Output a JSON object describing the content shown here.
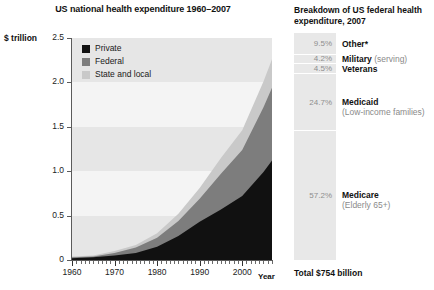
{
  "chart_data": [
    {
      "type": "area",
      "id": "national-health-expenditure",
      "title": "US national health expenditure 1960–2007",
      "xlabel": "Year",
      "ylabel": "$ trillion",
      "stacked": true,
      "grid": "horizontal-bands",
      "legend_position": "inside-top-left",
      "xlim": [
        1960,
        2007
      ],
      "ylim": [
        0,
        2.5
      ],
      "yticks": [
        "0",
        "0.5",
        "1.0",
        "1.5",
        "2.0",
        "2.5"
      ],
      "ytick_values": [
        0,
        0.5,
        1.0,
        1.5,
        2.0,
        2.5
      ],
      "xticks": [
        "1960",
        "1970",
        "1980",
        "1990",
        "2000"
      ],
      "xtick_values": [
        1960,
        1970,
        1980,
        1990,
        2000
      ],
      "x": [
        1960,
        1965,
        1970,
        1975,
        1980,
        1985,
        1990,
        1995,
        2000,
        2005,
        2007
      ],
      "series": [
        {
          "name": "Private",
          "color": "#111111",
          "values": [
            0.02,
            0.03,
            0.05,
            0.08,
            0.15,
            0.27,
            0.43,
            0.57,
            0.72,
            0.99,
            1.12
          ]
        },
        {
          "name": "Federal",
          "color": "#7d7d7d",
          "values": [
            0.01,
            0.01,
            0.03,
            0.06,
            0.1,
            0.17,
            0.26,
            0.4,
            0.52,
            0.73,
            0.82
          ]
        },
        {
          "name": "State and local",
          "color": "#c9c9c9",
          "values": [
            0.01,
            0.01,
            0.02,
            0.03,
            0.05,
            0.08,
            0.12,
            0.18,
            0.22,
            0.29,
            0.32
          ]
        }
      ],
      "totals": [
        0.04,
        0.05,
        0.1,
        0.17,
        0.3,
        0.52,
        0.81,
        1.15,
        1.46,
        2.01,
        2.26
      ]
    },
    {
      "type": "bar",
      "id": "federal-health-breakdown",
      "orientation": "vertical-stacked-single-bar",
      "title": "Breakdown of US federal health expenditure, 2007",
      "total_label": "Total $754 billion",
      "categories": [
        "Other*",
        "Military",
        "Veterans",
        "Medicaid",
        "Medicare"
      ],
      "values": [
        9.5,
        4.2,
        4.5,
        24.7,
        57.2
      ],
      "unit": "%",
      "segments": [
        {
          "pct": "9.5%",
          "value": 9.5,
          "name": "Other*",
          "sub": ""
        },
        {
          "pct": "4.2%",
          "value": 4.2,
          "name": "Military",
          "sub": "(serving)"
        },
        {
          "pct": "4.5%",
          "value": 4.5,
          "name": "Veterans",
          "sub": ""
        },
        {
          "pct": "24.7%",
          "value": 24.7,
          "name": "Medicaid",
          "sub": "(Low-income families)"
        },
        {
          "pct": "57.2%",
          "value": 57.2,
          "name": "Medicare",
          "sub": "(Elderly 65+)"
        }
      ]
    }
  ],
  "chart": {
    "title": "US national health expenditure 1960–2007",
    "y_axis_title": "$ trillion",
    "x_axis_title": "Year",
    "y_labels": [
      "2.5",
      "2.0",
      "1.5",
      "1.0",
      "0.5",
      "0"
    ],
    "x_labels": [
      "1960",
      "1970",
      "1980",
      "1990",
      "2000"
    ],
    "legend": [
      {
        "label": "Private",
        "color": "#111111"
      },
      {
        "label": "Federal",
        "color": "#7d7d7d"
      },
      {
        "label": "State and local",
        "color": "#c9c9c9"
      }
    ]
  },
  "breakdown": {
    "title": "Breakdown of US federal health expenditure, 2007",
    "total": "Total $754 billion",
    "items": [
      {
        "pct": "9.5%",
        "name": "Other*",
        "sub": ""
      },
      {
        "pct": "4.2%",
        "name": "Military",
        "sub": "(serving)"
      },
      {
        "pct": "4.5%",
        "name": "Veterans",
        "sub": ""
      },
      {
        "pct": "24.7%",
        "name": "Medicaid",
        "sub": "(Low-income families)"
      },
      {
        "pct": "57.2%",
        "name": "Medicare",
        "sub": "(Elderly 65+)"
      }
    ]
  },
  "colors": {
    "private": "#111111",
    "federal": "#7d7d7d",
    "state_local": "#c9c9c9",
    "plot_bg": "#f4f4f4",
    "band": "#e6e6e6",
    "bar_segment": "#e8e8e8"
  }
}
